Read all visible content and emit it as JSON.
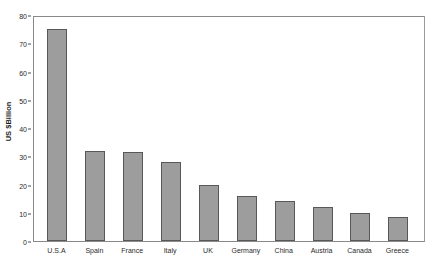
{
  "chart_data": {
    "type": "bar",
    "title": "",
    "xlabel": "",
    "ylabel": "US $Billion",
    "categories": [
      "U.S.A",
      "Spain",
      "France",
      "Italy",
      "UK",
      "Germany",
      "China",
      "Austria",
      "Canada",
      "Greece"
    ],
    "values": [
      75,
      32,
      31.5,
      28,
      20,
      16,
      14,
      12,
      10,
      8.5
    ],
    "ylim": [
      0,
      80
    ],
    "yticks": [
      0,
      10,
      20,
      30,
      40,
      50,
      60,
      70,
      80
    ],
    "ytick_labels": [
      "0",
      "10",
      "20",
      "30",
      "40",
      "50",
      "60",
      "70",
      "80"
    ],
    "grid": false,
    "legend": false,
    "bar_color": "#9d9d9d",
    "bar_edge_color": "#585858",
    "frame_color": "#8a8a8a",
    "background": "#ffffff"
  }
}
